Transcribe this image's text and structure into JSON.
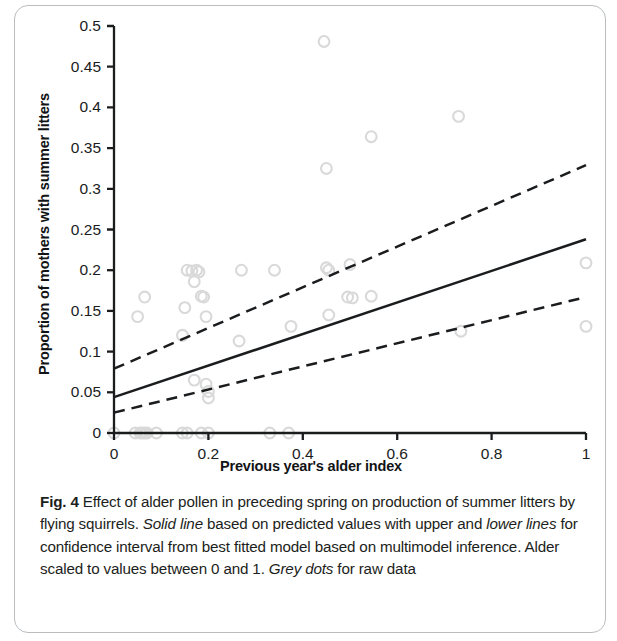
{
  "figure": {
    "label": "Fig. 4",
    "caption_parts": [
      {
        "text": "Fig. 4",
        "style": "bold"
      },
      {
        "text": " Effect of alder pollen in preceding spring on production of summer litters by flying squirrels. ",
        "style": "normal"
      },
      {
        "text": "Solid line",
        "style": "italic"
      },
      {
        "text": " based on predicted values with upper and ",
        "style": "normal"
      },
      {
        "text": "lower lines",
        "style": "italic"
      },
      {
        "text": " for confidence interval from best fitted model based on multimodel inference. Alder scaled to values between 0 and 1. ",
        "style": "normal"
      },
      {
        "text": "Grey dots",
        "style": "italic"
      },
      {
        "text": " for raw data",
        "style": "normal"
      }
    ],
    "caption_plain": "Fig. 4 Effect of alder pollen in preceding spring on production of summer litters by flying squirrels. Solid line based on predicted values with upper and lower lines for confidence interval from best fitted model based on multimodel inference. Alder scaled to values between 0 and 1. Grey dots for raw data"
  },
  "colors": {
    "axis": "#1a1c1e",
    "line": "#1a1c1e",
    "dots": "#d9d9d9",
    "text": "#1c1e20",
    "card_border": "#b9bdc0",
    "background": "#ffffff"
  },
  "chart_data": {
    "type": "scatter",
    "title": "",
    "xlabel": "Previous year's alder index",
    "ylabel": "Proportion of mothers with summer litters",
    "xlim": [
      0,
      1
    ],
    "ylim": [
      0,
      0.5
    ],
    "grid": false,
    "legend": "none",
    "xticks": [
      0,
      0.2,
      0.4,
      0.6,
      0.8,
      1
    ],
    "xtick_labels": [
      "0",
      "0.2",
      "0.4",
      "0.6",
      "0.8",
      "1"
    ],
    "yticks": [
      0,
      0.05,
      0.1,
      0.15,
      0.2,
      0.25,
      0.3,
      0.35,
      0.4,
      0.45,
      0.5
    ],
    "ytick_labels": [
      "0",
      "0.05",
      "0.1",
      "0.15",
      "0.2",
      "0.25",
      "0.3",
      "0.35",
      "0.4",
      "0.45",
      "0.5"
    ],
    "series": [
      {
        "name": "Grey dots (raw data)",
        "type": "scatter",
        "color": "#d9d9d9",
        "points": [
          [
            0.0,
            0.0
          ],
          [
            0.045,
            0.0
          ],
          [
            0.055,
            0.0
          ],
          [
            0.06,
            0.0
          ],
          [
            0.065,
            0.0
          ],
          [
            0.07,
            0.0
          ],
          [
            0.09,
            0.0
          ],
          [
            0.145,
            0.0
          ],
          [
            0.155,
            0.0
          ],
          [
            0.185,
            0.0
          ],
          [
            0.2,
            0.0
          ],
          [
            0.33,
            0.0
          ],
          [
            0.37,
            0.0
          ],
          [
            0.05,
            0.143
          ],
          [
            0.065,
            0.167
          ],
          [
            0.145,
            0.12
          ],
          [
            0.15,
            0.154
          ],
          [
            0.155,
            0.2
          ],
          [
            0.165,
            0.199
          ],
          [
            0.17,
            0.186
          ],
          [
            0.17,
            0.065
          ],
          [
            0.175,
            0.2
          ],
          [
            0.18,
            0.198
          ],
          [
            0.185,
            0.168
          ],
          [
            0.19,
            0.167
          ],
          [
            0.195,
            0.143
          ],
          [
            0.195,
            0.06
          ],
          [
            0.2,
            0.051
          ],
          [
            0.2,
            0.043
          ],
          [
            0.265,
            0.113
          ],
          [
            0.27,
            0.2
          ],
          [
            0.34,
            0.2
          ],
          [
            0.375,
            0.131
          ],
          [
            0.445,
            0.481
          ],
          [
            0.45,
            0.325
          ],
          [
            0.45,
            0.203
          ],
          [
            0.455,
            0.2
          ],
          [
            0.455,
            0.145
          ],
          [
            0.495,
            0.167
          ],
          [
            0.5,
            0.207
          ],
          [
            0.505,
            0.166
          ],
          [
            0.545,
            0.168
          ],
          [
            0.545,
            0.364
          ],
          [
            0.73,
            0.389
          ],
          [
            0.735,
            0.125
          ],
          [
            1.0,
            0.209
          ],
          [
            1.0,
            0.131
          ]
        ]
      },
      {
        "name": "Solid line (predicted values)",
        "type": "line",
        "style": "solid",
        "color": "#1a1c1e",
        "x": [
          0,
          1
        ],
        "values": [
          0.044,
          0.238
        ]
      },
      {
        "name": "Upper line (confidence interval)",
        "type": "line",
        "style": "dashed",
        "color": "#1a1c1e",
        "x": [
          0,
          1
        ],
        "values": [
          0.079,
          0.329
        ]
      },
      {
        "name": "Lower line (confidence interval)",
        "type": "line",
        "style": "dashed",
        "color": "#1a1c1e",
        "x": [
          0,
          1
        ],
        "values": [
          0.025,
          0.167
        ]
      }
    ]
  }
}
